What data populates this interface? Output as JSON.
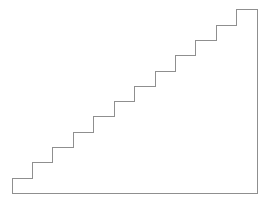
{
  "figure": {
    "name": "staircase-outline",
    "kind": "line-drawing",
    "background_color": "#ffffff",
    "stroke_color": "#8f8f8f",
    "stroke_width": 1,
    "fill": "none",
    "canvas": {
      "width": 274,
      "height": 210
    },
    "geometry": {
      "step_count": 12,
      "tread_run": 20.4,
      "riser_rise": 15.3,
      "base_left_x": 12,
      "base_y": 193,
      "apex_x": 257,
      "apex_y": 9,
      "right_edge_x": 257,
      "bottom_y": 193,
      "total_width": 245,
      "total_height": 184
    },
    "path": "M 12 193 L 12 178 L 32.4 178 L 32.4 162.7 L 52.8 162.7 L 52.8 147.4 L 73.3 147.4 L 73.3 132.2 L 93.7 132.2 L 93.7 116.9 L 114.1 116.9 L 114.1 101.6 L 134.5 101.6 L 134.5 86.3 L 155 86.3 L 155 71 L 175.4 71 L 175.4 55.7 L 195.8 55.7 L 195.8 40.4 L 216.2 40.4 L 216.2 25.2 L 236.6 25.2 L 236.6 9.9 L 257 9.9 L 257 193 Z",
    "labels": []
  }
}
